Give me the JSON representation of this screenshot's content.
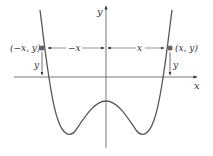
{
  "diagram": {
    "axes": {
      "x_label": "x",
      "y_label": "y"
    },
    "points": {
      "left": "(−x, y)",
      "right": "(x, y)"
    },
    "distances": {
      "left": "−x",
      "right": "x",
      "left_height": "y",
      "right_height": "y"
    },
    "colors": {
      "curve": "#555555",
      "axis": "#555555",
      "point": "#666666"
    }
  }
}
